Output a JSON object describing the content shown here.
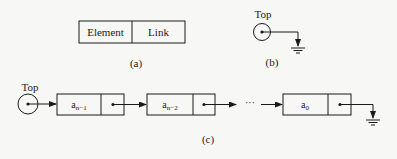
{
  "panel_a": {
    "caption": "(a)",
    "fields": [
      "Element",
      "Link"
    ]
  },
  "panel_b": {
    "caption": "(b)",
    "pointer_label": "Top"
  },
  "panel_c": {
    "caption": "(c)",
    "pointer_label": "Top",
    "nodes": [
      {
        "base": "a",
        "sub": "n−1"
      },
      {
        "base": "a",
        "sub": "n−2"
      },
      {
        "base": "a",
        "sub": "0"
      }
    ],
    "ellipsis": "···"
  },
  "colors": {
    "stroke": "#1a1a1a",
    "background": "#f7f7f5"
  }
}
